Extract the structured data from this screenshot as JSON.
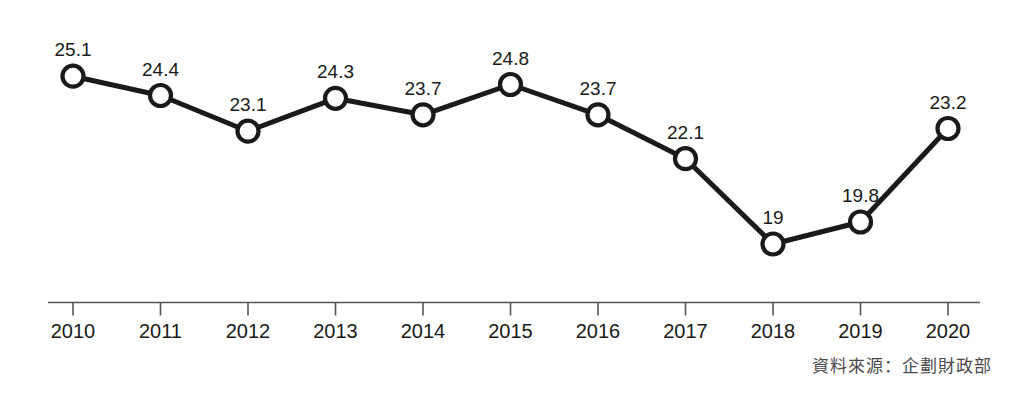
{
  "chart_data": {
    "type": "line",
    "title": "",
    "subtitle": "",
    "xlabel": "",
    "ylabel": "",
    "categories": [
      "2010",
      "2011",
      "2012",
      "2013",
      "2014",
      "2015",
      "2016",
      "2017",
      "2018",
      "2019",
      "2020"
    ],
    "values": [
      25.1,
      24.4,
      23.1,
      24.3,
      23.7,
      24.8,
      23.7,
      22.1,
      19,
      19.8,
      23.2
    ],
    "point_labels": [
      "25.1",
      "24.4",
      "23.1",
      "24.3",
      "23.7",
      "24.8",
      "23.7",
      "22.1",
      "19",
      "19.8",
      "23.2"
    ],
    "series": [
      {
        "name": "",
        "values": [
          25.1,
          24.4,
          23.1,
          24.3,
          23.7,
          24.8,
          23.7,
          22.1,
          19,
          19.8,
          23.2
        ]
      }
    ],
    "ylim": [
      18.2,
      25.8
    ],
    "xlim": [
      "2010",
      "2020"
    ],
    "grid": false,
    "legend": "none",
    "y_axis_visible": false,
    "x_axis_visible": true,
    "marker": "open-circle",
    "marker_fill": "#ffffff",
    "line_color": "#1a1a1a",
    "line_width": 5,
    "annotations": [
      "資料來源：企劃財政部"
    ]
  },
  "colors": {
    "line": "#1a1a1a",
    "marker_fill": "#ffffff",
    "marker_stroke": "#1a1a1a",
    "axis": "#555555",
    "label_text": "#1a1a1a",
    "source_text": "#4a4a4a",
    "background": "#ffffff"
  },
  "axis": {
    "tick_labels": [
      "2010",
      "2011",
      "2012",
      "2013",
      "2014",
      "2015",
      "2016",
      "2017",
      "2018",
      "2019",
      "2020"
    ]
  },
  "footer": {
    "source_label": "資料來源：企劃財政部"
  }
}
